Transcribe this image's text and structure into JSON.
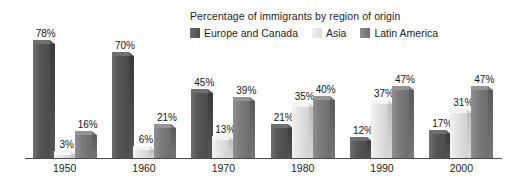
{
  "chart_data": {
    "type": "bar",
    "title": "Percentage of immigrants by region of origin",
    "xlabel": "",
    "ylabel": "",
    "ylim": [
      0,
      80
    ],
    "grid": false,
    "legend_position": "top-right",
    "value_suffix": "%",
    "categories": [
      "1950",
      "1960",
      "1970",
      "1980",
      "1990",
      "2000"
    ],
    "series": [
      {
        "name": "Europe and Canada",
        "color": "#575757",
        "values": [
          78,
          70,
          45,
          21,
          12,
          17
        ],
        "labels": [
          "78%",
          "70%",
          "45%",
          "21%",
          "12%",
          "17%"
        ]
      },
      {
        "name": "Asia",
        "color": "#e4e4e4",
        "values": [
          3,
          6,
          13,
          35,
          37,
          31
        ],
        "labels": [
          "3%",
          "6%",
          "13%",
          "35%",
          "37%",
          "31%"
        ]
      },
      {
        "name": "Latin America",
        "color": "#7c7c7c",
        "values": [
          16,
          21,
          39,
          40,
          47,
          47
        ],
        "labels": [
          "16%",
          "21%",
          "39%",
          "40%",
          "47%",
          "47%"
        ]
      }
    ]
  },
  "legend": {
    "title": "Percentage of immigrants by region of origin",
    "items": [
      {
        "label": "Europe and Canada",
        "swatch": "legend-swatch-europe-and-canada"
      },
      {
        "label": "Asia",
        "swatch": "legend-swatch-asia"
      },
      {
        "label": "Latin America",
        "swatch": "legend-swatch-latin-america"
      }
    ]
  },
  "axis": {
    "ticks": [
      "1950",
      "1960",
      "1970",
      "1980",
      "1990",
      "2000"
    ]
  }
}
